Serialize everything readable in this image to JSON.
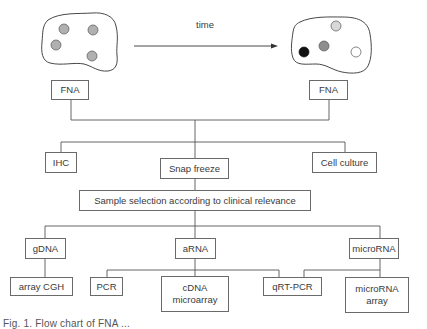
{
  "diagram": {
    "time_label": "time",
    "tumor_before": {
      "cells": [
        {
          "color": "#b0b0b0"
        },
        {
          "color": "#b0b0b0"
        },
        {
          "color": "#b0b0b0"
        },
        {
          "color": "#b0b0b0"
        }
      ]
    },
    "tumor_after": {
      "cells": [
        {
          "color": "#d8d8d8"
        },
        {
          "color": "#111111"
        },
        {
          "color": "#8e8e8e"
        },
        {
          "color": "#ffffff"
        }
      ]
    },
    "nodes": {
      "fna_left": "FNA",
      "fna_right": "FNA",
      "ihc": "IHC",
      "snap_freeze": "Snap freeze",
      "cell_culture": "Cell culture",
      "sample_selection": "Sample selection according to clinical relevance",
      "gdna": "gDNA",
      "arna": "aRNA",
      "microrna": "microRNA",
      "array_cgh": "array CGH",
      "pcr": "PCR",
      "cdna_microarray": "cDNA\nmicroarray",
      "qrt_pcr": "qRT-PCR",
      "microrna_array": "microRNA\narray"
    },
    "caption": "Fig. 1. Flow chart of FNA ..."
  }
}
